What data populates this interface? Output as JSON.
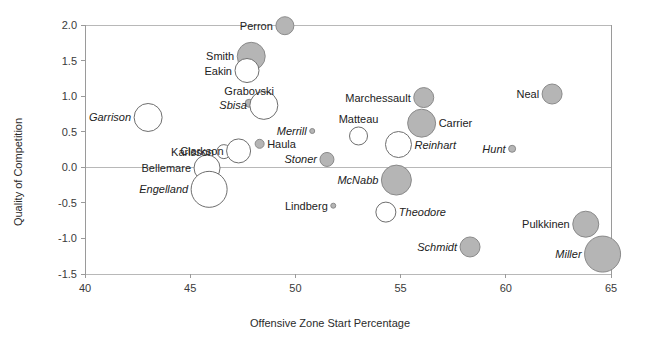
{
  "chart_data": {
    "type": "scatter",
    "title": "",
    "xlabel": "Offensive Zone Start Percentage",
    "ylabel": "Quality of Competition",
    "xlim": [
      40,
      65
    ],
    "ylim": [
      -1.5,
      2.0
    ],
    "xticks": [
      "40",
      "45",
      "50",
      "55",
      "60",
      "65"
    ],
    "yticks": [
      "2.0",
      "1.5",
      "1.0",
      "0.5",
      "0.0",
      "-0.5",
      "-1.0",
      "-1.5"
    ],
    "grid": "horizontal-partial",
    "legend": "none",
    "note": "Bubble size encodes a third variable (e.g. ice time); fill gray vs white encodes a binary category.",
    "points": [
      {
        "label": "Perron",
        "x": 49.5,
        "y": 1.99,
        "size": 9,
        "fill": "gray",
        "label_pos": "left",
        "italic": false
      },
      {
        "label": "Smith",
        "x": 47.9,
        "y": 1.56,
        "size": 14,
        "fill": "gray",
        "label_pos": "left",
        "italic": false
      },
      {
        "label": "Eakin",
        "x": 47.7,
        "y": 1.36,
        "size": 12,
        "fill": "white",
        "label_pos": "left",
        "italic": false
      },
      {
        "label": "Grabovski",
        "x": 47.8,
        "y": 0.9,
        "size": 4,
        "fill": "gray",
        "label_pos": "above",
        "italic": false
      },
      {
        "label": "Sbisa",
        "x": 48.5,
        "y": 0.87,
        "size": 14,
        "fill": "white",
        "label_pos": "left",
        "italic": true
      },
      {
        "label": "Garrison",
        "x": 43.0,
        "y": 0.7,
        "size": 14,
        "fill": "white",
        "label_pos": "left",
        "italic": true
      },
      {
        "label": "Marchessault",
        "x": 56.1,
        "y": 0.98,
        "size": 10,
        "fill": "gray",
        "label_pos": "left",
        "italic": false
      },
      {
        "label": "Neal",
        "x": 62.2,
        "y": 1.03,
        "size": 10,
        "fill": "gray",
        "label_pos": "left",
        "italic": false
      },
      {
        "label": "Carrier",
        "x": 56.0,
        "y": 0.62,
        "size": 14,
        "fill": "gray",
        "label_pos": "right",
        "italic": false
      },
      {
        "label": "Matteau",
        "x": 53.0,
        "y": 0.44,
        "size": 9,
        "fill": "white",
        "label_pos": "above",
        "italic": false
      },
      {
        "label": "Reinhart",
        "x": 54.9,
        "y": 0.32,
        "size": 13,
        "fill": "white",
        "label_pos": "right",
        "italic": true
      },
      {
        "label": "Merrill",
        "x": 50.8,
        "y": 0.51,
        "size": 2.5,
        "fill": "gray",
        "label_pos": "left",
        "italic": true
      },
      {
        "label": "Haula",
        "x": 48.3,
        "y": 0.33,
        "size": 4.5,
        "fill": "gray",
        "label_pos": "right",
        "italic": false
      },
      {
        "label": "Hunt",
        "x": 60.3,
        "y": 0.26,
        "size": 3.5,
        "fill": "gray",
        "label_pos": "left",
        "italic": true
      },
      {
        "label": "Karlsson",
        "x": 46.6,
        "y": 0.22,
        "size": 7,
        "fill": "white",
        "label_pos": "left",
        "italic": false
      },
      {
        "label": "Clarkson",
        "x": 47.3,
        "y": 0.23,
        "size": 12,
        "fill": "white",
        "label_pos": "left",
        "italic": false
      },
      {
        "label": "Stoner",
        "x": 51.5,
        "y": 0.11,
        "size": 7,
        "fill": "gray",
        "label_pos": "left",
        "italic": true
      },
      {
        "label": "Bellemare",
        "x": 45.8,
        "y": -0.01,
        "size": 13,
        "fill": "white",
        "label_pos": "left",
        "italic": false
      },
      {
        "label": "McNabb",
        "x": 54.8,
        "y": -0.18,
        "size": 15,
        "fill": "gray",
        "label_pos": "left",
        "italic": true
      },
      {
        "label": "Engelland",
        "x": 45.9,
        "y": -0.31,
        "size": 18,
        "fill": "white",
        "label_pos": "left",
        "italic": true
      },
      {
        "label": "Lindberg",
        "x": 51.8,
        "y": -0.54,
        "size": 2.5,
        "fill": "gray",
        "label_pos": "left",
        "italic": false
      },
      {
        "label": "Theodore",
        "x": 54.3,
        "y": -0.63,
        "size": 10,
        "fill": "white",
        "label_pos": "right",
        "italic": true
      },
      {
        "label": "Pulkkinen",
        "x": 63.8,
        "y": -0.8,
        "size": 13,
        "fill": "gray",
        "label_pos": "left",
        "italic": false
      },
      {
        "label": "Schmidt",
        "x": 58.3,
        "y": -1.12,
        "size": 10,
        "fill": "gray",
        "label_pos": "left",
        "italic": true
      },
      {
        "label": "Miller",
        "x": 64.6,
        "y": -1.22,
        "size": 18,
        "fill": "gray",
        "label_pos": "left",
        "italic": true
      }
    ]
  }
}
